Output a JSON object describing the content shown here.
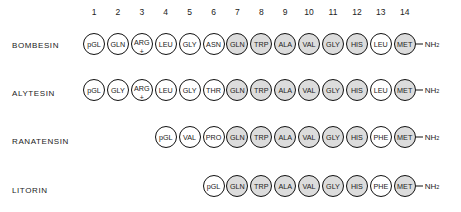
{
  "positions": [
    "1",
    "2",
    "3",
    "4",
    "5",
    "6",
    "7",
    "8",
    "9",
    "10",
    "11",
    "12",
    "13",
    "14"
  ],
  "terminal": "NH",
  "terminal_sub": "2",
  "charge_symbol": "+",
  "shading": {
    "shaded_color": "#dcdcdc",
    "unshaded_color": "#ffffff",
    "border_color": "#111111"
  },
  "peptides": [
    {
      "name": "BOMBESIN",
      "start_position": 1,
      "residues": [
        {
          "label": "pGL",
          "shaded": false
        },
        {
          "label": "GLN",
          "shaded": false
        },
        {
          "label": "ARG",
          "shaded": false,
          "charge": "+"
        },
        {
          "label": "LEU",
          "shaded": false
        },
        {
          "label": "GLY",
          "shaded": false
        },
        {
          "label": "ASN",
          "shaded": false
        },
        {
          "label": "GLN",
          "shaded": true
        },
        {
          "label": "TRP",
          "shaded": true
        },
        {
          "label": "ALA",
          "shaded": true
        },
        {
          "label": "VAL",
          "shaded": true
        },
        {
          "label": "GLY",
          "shaded": true
        },
        {
          "label": "HIS",
          "shaded": true
        },
        {
          "label": "LEU",
          "shaded": false
        },
        {
          "label": "MET",
          "shaded": true
        }
      ]
    },
    {
      "name": "ALYTESIN",
      "start_position": 1,
      "residues": [
        {
          "label": "pGL",
          "shaded": false
        },
        {
          "label": "GLY",
          "shaded": false
        },
        {
          "label": "ARG",
          "shaded": false,
          "charge": "+"
        },
        {
          "label": "LEU",
          "shaded": false
        },
        {
          "label": "GLY",
          "shaded": false
        },
        {
          "label": "THR",
          "shaded": false
        },
        {
          "label": "GLN",
          "shaded": true
        },
        {
          "label": "TRP",
          "shaded": true
        },
        {
          "label": "ALA",
          "shaded": true
        },
        {
          "label": "VAL",
          "shaded": true
        },
        {
          "label": "GLY",
          "shaded": true
        },
        {
          "label": "HIS",
          "shaded": true
        },
        {
          "label": "LEU",
          "shaded": false
        },
        {
          "label": "MET",
          "shaded": true
        }
      ]
    },
    {
      "name": "RANATENSIN",
      "start_position": 4,
      "residues": [
        {
          "label": "pGL",
          "shaded": false
        },
        {
          "label": "VAL",
          "shaded": false
        },
        {
          "label": "PRO",
          "shaded": false
        },
        {
          "label": "GLN",
          "shaded": true
        },
        {
          "label": "TRP",
          "shaded": true
        },
        {
          "label": "ALA",
          "shaded": true
        },
        {
          "label": "VAL",
          "shaded": true
        },
        {
          "label": "GLY",
          "shaded": true
        },
        {
          "label": "HIS",
          "shaded": true
        },
        {
          "label": "PHE",
          "shaded": false
        },
        {
          "label": "MET",
          "shaded": true
        }
      ]
    },
    {
      "name": "LITORIN",
      "start_position": 6,
      "residues": [
        {
          "label": "pGL",
          "shaded": false
        },
        {
          "label": "GLN",
          "shaded": true
        },
        {
          "label": "TRP",
          "shaded": true
        },
        {
          "label": "ALA",
          "shaded": true
        },
        {
          "label": "VAL",
          "shaded": true
        },
        {
          "label": "GLY",
          "shaded": true
        },
        {
          "label": "HIS",
          "shaded": true
        },
        {
          "label": "PHE",
          "shaded": false
        },
        {
          "label": "MET",
          "shaded": true
        }
      ]
    }
  ]
}
